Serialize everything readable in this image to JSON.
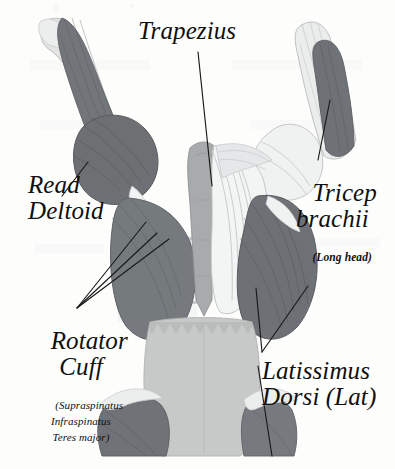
{
  "figure": {
    "background_color": "#fdfdfc",
    "ink_color": "#101010",
    "view": "posterior (rear) view of upper back and arms"
  },
  "palette": {
    "background": "#fdfdfc",
    "muscle_dark": "#6f7175",
    "muscle_mid": "#8f9195",
    "muscle_light": "#c9cbcd",
    "muscle_pale": "#e9eaec",
    "bone": "#dfe0df",
    "fascia": "#bfc2c2",
    "outline": "#5c5e61",
    "leader_line": "#1a1a1a"
  },
  "labels": [
    {
      "id": "trapezius",
      "name": "Trapezius",
      "text": "Trapezius",
      "sub": "",
      "x": 138,
      "y": 18,
      "leaders": [
        [
          198,
          52,
          212,
          186
        ]
      ]
    },
    {
      "id": "read-deltoid",
      "name": "Read Deltoid",
      "text": "Read\nDeltoid",
      "sub": "",
      "x": 28,
      "y": 172,
      "leaders": [
        [
          88,
          162,
          62,
          196
        ]
      ]
    },
    {
      "id": "tricep-brachii",
      "name": "Tricep brachii",
      "text": "Tricep\nbrachii",
      "sub": "(Long head)",
      "x": 296,
      "y": 164,
      "leaders": [
        [
          318,
          160,
          330,
          100
        ]
      ]
    },
    {
      "id": "rotator-cuff",
      "name": "Rotator Cuff",
      "text": "Rotator\nCuff",
      "sub": "(Supraspinatus\nInfraspinatus\nTeres major)",
      "x": 22,
      "y": 312,
      "leaders": [
        [
          77,
          308,
          146,
          222
        ],
        [
          77,
          308,
          156,
          232
        ],
        [
          77,
          308,
          168,
          238
        ]
      ]
    },
    {
      "id": "latissimus-dorsi",
      "name": "Latissimus Dorsi (Lat)",
      "text": "Latissimus\nDorsi (Lat)",
      "sub": "",
      "x": 262,
      "y": 358,
      "leaders": [
        [
          262,
          352,
          308,
          286
        ],
        [
          262,
          352,
          256,
          288
        ],
        [
          258,
          366,
          272,
          456
        ]
      ]
    }
  ],
  "annotations": {
    "rotator_cuff_components": [
      "Supraspinatus",
      "Infraspinatus",
      "Teres major"
    ],
    "tricep_head": "Long head",
    "lat_abbreviation": "Lat"
  },
  "anatomy_regions": [
    "left humerus (bone)",
    "left tricep brachii",
    "left posterior deltoid",
    "rib cage",
    "thoracolumbar spine",
    "trapezius",
    "right tricep brachii (long head)",
    "right latissimus dorsi",
    "thoracolumbar fascia",
    "gluteal muscles"
  ]
}
